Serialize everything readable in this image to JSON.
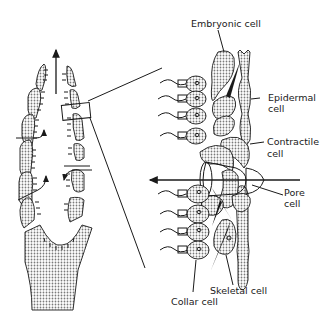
{
  "figure": {
    "type": "biological-diagram",
    "colors": {
      "ink": "#1a1a1a",
      "background": "#ffffff",
      "stipple": "#9a9a9a"
    }
  },
  "labels": {
    "embryonic": "Embryonic cell",
    "epidermal_1": "Epidermal",
    "epidermal_2": "cell",
    "contractile_1": "Contractile",
    "contractile_2": "cell",
    "pore_1": "Pore",
    "pore_2": "cell",
    "skeletal": "Skeletal cell",
    "collar": "Collar cell"
  }
}
